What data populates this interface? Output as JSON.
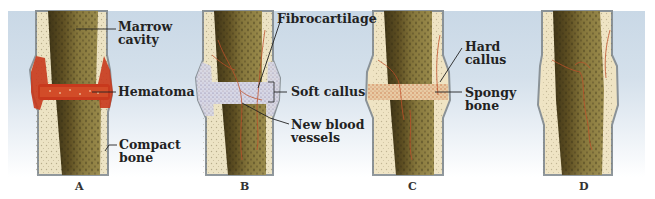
{
  "figure": {
    "panels": [
      {
        "id": "A",
        "letter": "A",
        "labels": [
          "Marrow cavity",
          "Hematoma",
          "Compact bone"
        ]
      },
      {
        "id": "B",
        "letter": "B",
        "labels": [
          "Fibrocartilage",
          "Soft callus",
          "New blood vessels"
        ]
      },
      {
        "id": "C",
        "letter": "C",
        "labels": [
          "Hard callus",
          "Spongy bone"
        ]
      },
      {
        "id": "D",
        "letter": "D",
        "labels": []
      }
    ]
  },
  "labels": {
    "marrow_1": "Marrow",
    "marrow_2": "cavity",
    "hematoma": "Hematoma",
    "compact_1": "Compact",
    "compact_2": "bone",
    "fibrocartilage": "Fibrocartilage",
    "soft_callus": "Soft callus",
    "vessels_1": "New blood",
    "vessels_2": "vessels",
    "hard_1": "Hard",
    "hard_2": "callus",
    "spongy_1": "Spongy",
    "spongy_2": "bone"
  },
  "letters": {
    "a": "A",
    "b": "B",
    "c": "C",
    "d": "D"
  },
  "colors": {
    "background_top": "#c9d8e6",
    "compact_bone": "#ece3c4",
    "marrow": "#6b5a2a",
    "marrow_light": "#8c7a3e",
    "periosteum": "#8a9297",
    "hematoma": "#c8391d",
    "fibrocartilage": "#d8d8e8",
    "blood_vessel": "#c0502a",
    "hard_callus": "#efe4c4"
  }
}
